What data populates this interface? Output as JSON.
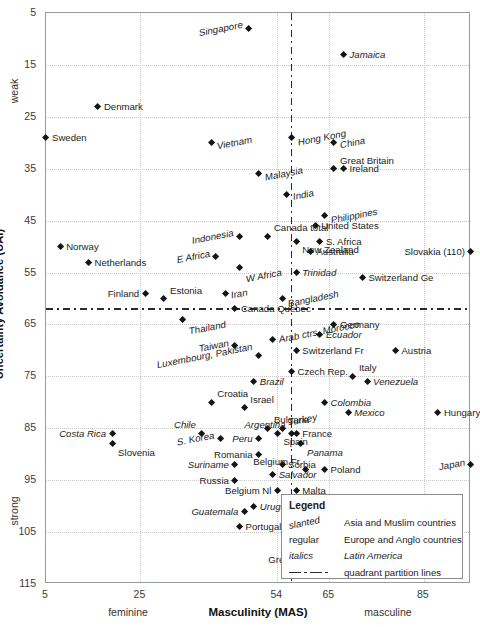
{
  "chart_data": {
    "type": "scatter",
    "title": "",
    "xlabel": "Masculinity (MAS)",
    "ylabel": "Uncertainty Avoidance (UAI)",
    "xlim": [
      5,
      95
    ],
    "ylim": [
      5,
      115
    ],
    "x_ticks": [
      "5",
      "25",
      "54",
      "65",
      "85"
    ],
    "x_tick_values": [
      5,
      25,
      54,
      65,
      85
    ],
    "y_ticks": [
      "5",
      "15",
      "25",
      "35",
      "45",
      "55",
      "65",
      "75",
      "85",
      "95",
      "105",
      "115"
    ],
    "y_tick_values": [
      5,
      15,
      25,
      35,
      45,
      55,
      65,
      75,
      85,
      95,
      105,
      115
    ],
    "x_pole_low": "feminine",
    "x_pole_high": "masculine",
    "y_pole_low": "weak",
    "y_pole_high": "strong",
    "grid": true,
    "partition_x": 57,
    "partition_y": 62,
    "axis_inverted_y": true,
    "points": [
      {
        "label": "Singapore",
        "x": 48,
        "y": 8,
        "style": "slanted",
        "pos": "left"
      },
      {
        "label": "Jamaica",
        "x": 68,
        "y": 13,
        "style": "italics",
        "pos": "right"
      },
      {
        "label": "Denmark",
        "x": 16,
        "y": 23,
        "style": "regular",
        "pos": "right"
      },
      {
        "label": "Sweden",
        "x": 5,
        "y": 29,
        "style": "regular",
        "pos": "right"
      },
      {
        "label": "Vietnam",
        "x": 40,
        "y": 30,
        "style": "slanted",
        "pos": "right"
      },
      {
        "label": "Hong Kong",
        "x": 57,
        "y": 29,
        "style": "slanted",
        "pos": "right"
      },
      {
        "label": "China",
        "x": 66,
        "y": 30,
        "style": "slanted",
        "pos": "right"
      },
      {
        "label": "Malaysia",
        "x": 50,
        "y": 36,
        "style": "slanted",
        "pos": "right"
      },
      {
        "label": "Great Britain",
        "x": 66,
        "y": 35,
        "style": "regular",
        "pos": "above"
      },
      {
        "label": "Ireland",
        "x": 68,
        "y": 35,
        "style": "regular",
        "pos": "right"
      },
      {
        "label": "India",
        "x": 56,
        "y": 40,
        "style": "slanted",
        "pos": "right"
      },
      {
        "label": "Philippines",
        "x": 64,
        "y": 44,
        "style": "slanted",
        "pos": "right"
      },
      {
        "label": "Norway",
        "x": 8,
        "y": 50,
        "style": "regular",
        "pos": "right"
      },
      {
        "label": "Netherlands",
        "x": 14,
        "y": 53,
        "style": "regular",
        "pos": "right"
      },
      {
        "label": "Indonesia",
        "x": 46,
        "y": 48,
        "style": "slanted",
        "pos": "left"
      },
      {
        "label": "Canada total",
        "x": 52,
        "y": 48,
        "style": "regular",
        "pos": "above"
      },
      {
        "label": "United States",
        "x": 62,
        "y": 46,
        "style": "regular",
        "pos": "right"
      },
      {
        "label": "S. Africa",
        "x": 63,
        "y": 49,
        "style": "regular",
        "pos": "right"
      },
      {
        "label": "New Zealand",
        "x": 58,
        "y": 49,
        "style": "regular",
        "pos": "below"
      },
      {
        "label": "Australia",
        "x": 61,
        "y": 51,
        "style": "regular",
        "pos": "right"
      },
      {
        "label": "E Africa",
        "x": 41,
        "y": 52,
        "style": "slanted",
        "pos": "left"
      },
      {
        "label": "Slovakia (110)",
        "x": 95,
        "y": 51,
        "style": "regular",
        "pos": "left"
      },
      {
        "label": "W Africa",
        "x": 46,
        "y": 54,
        "style": "slanted",
        "pos": "below"
      },
      {
        "label": "Finland",
        "x": 26,
        "y": 59,
        "style": "regular",
        "pos": "left"
      },
      {
        "label": "Estonia",
        "x": 30,
        "y": 60,
        "style": "regular",
        "pos": "above"
      },
      {
        "label": "Iran",
        "x": 43,
        "y": 59,
        "style": "slanted",
        "pos": "right"
      },
      {
        "label": "Trinidad",
        "x": 58,
        "y": 55,
        "style": "italics",
        "pos": "right"
      },
      {
        "label": "Switzerland Ge",
        "x": 72,
        "y": 56,
        "style": "regular",
        "pos": "right"
      },
      {
        "label": "Canada Quebec",
        "x": 45,
        "y": 62,
        "style": "regular",
        "pos": "right"
      },
      {
        "label": "Bangladesh",
        "x": 55,
        "y": 60,
        "style": "slanted",
        "pos": "right"
      },
      {
        "label": "Thailand",
        "x": 34,
        "y": 64,
        "style": "slanted",
        "pos": "below"
      },
      {
        "label": "Arab ctrs, Morocco",
        "x": 53,
        "y": 68,
        "style": "slanted",
        "pos": "above"
      },
      {
        "label": "Germany",
        "x": 66,
        "y": 65,
        "style": "regular",
        "pos": "right"
      },
      {
        "label": "Ecuador",
        "x": 63,
        "y": 67,
        "style": "italics",
        "pos": "right"
      },
      {
        "label": "Taiwan",
        "x": 45,
        "y": 69,
        "style": "slanted",
        "pos": "left"
      },
      {
        "label": "Switzerland Fr",
        "x": 58,
        "y": 70,
        "style": "regular",
        "pos": "right"
      },
      {
        "label": "Austria",
        "x": 79,
        "y": 70,
        "style": "regular",
        "pos": "right"
      },
      {
        "label": "Luxembourg, Pakistan",
        "x": 50,
        "y": 71,
        "style": "slanted",
        "pos": "left"
      },
      {
        "label": "Czech Rep.",
        "x": 57,
        "y": 74,
        "style": "regular",
        "pos": "right"
      },
      {
        "label": "Italy",
        "x": 70,
        "y": 75,
        "style": "regular",
        "pos": "above"
      },
      {
        "label": "Brazil",
        "x": 49,
        "y": 76,
        "style": "italics",
        "pos": "right"
      },
      {
        "label": "Venezuela",
        "x": 73,
        "y": 76,
        "style": "italics",
        "pos": "right"
      },
      {
        "label": "Croatia",
        "x": 40,
        "y": 80,
        "style": "regular",
        "pos": "above"
      },
      {
        "label": "Israel",
        "x": 47,
        "y": 81,
        "style": "regular",
        "pos": "above"
      },
      {
        "label": "Colombia",
        "x": 64,
        "y": 80,
        "style": "italics",
        "pos": "right"
      },
      {
        "label": "Mexico",
        "x": 69,
        "y": 82,
        "style": "italics",
        "pos": "right"
      },
      {
        "label": "Hungary",
        "x": 88,
        "y": 82,
        "style": "regular",
        "pos": "right"
      },
      {
        "label": "Bulgaria",
        "x": 52,
        "y": 85,
        "style": "regular",
        "pos": "above"
      },
      {
        "label": "Turkey",
        "x": 55,
        "y": 85,
        "style": "slanted",
        "pos": "above"
      },
      {
        "label": "Chile",
        "x": 38,
        "y": 86,
        "style": "italics",
        "pos": "lefta"
      },
      {
        "label": "Costa Rica",
        "x": 19,
        "y": 86,
        "style": "italics",
        "pos": "left"
      },
      {
        "label": "S. Korea",
        "x": 42,
        "y": 87,
        "style": "slanted",
        "pos": "left"
      },
      {
        "label": "Argentina",
        "x": 57,
        "y": 86,
        "style": "italics",
        "pos": "lefta"
      },
      {
        "label": "France",
        "x": 58,
        "y": 86,
        "style": "regular",
        "pos": "right"
      },
      {
        "label": "Spain",
        "x": 54,
        "y": 86,
        "style": "regular",
        "pos": "below"
      },
      {
        "label": "Peru",
        "x": 50,
        "y": 87,
        "style": "italics",
        "pos": "left"
      },
      {
        "label": "Panama",
        "x": 59,
        "y": 88,
        "style": "italics",
        "pos": "below"
      },
      {
        "label": "Slovenia",
        "x": 19,
        "y": 88,
        "style": "regular",
        "pos": "below"
      },
      {
        "label": "Romania",
        "x": 50,
        "y": 90,
        "style": "regular",
        "pos": "left"
      },
      {
        "label": "Suriname",
        "x": 45,
        "y": 92,
        "style": "italics",
        "pos": "left"
      },
      {
        "label": "Sorbia",
        "x": 55,
        "y": 92,
        "style": "regular",
        "pos": "right"
      },
      {
        "label": "Salvador",
        "x": 53,
        "y": 94,
        "style": "italics",
        "pos": "right"
      },
      {
        "label": "Russia",
        "x": 45,
        "y": 95,
        "style": "regular",
        "pos": "left"
      },
      {
        "label": "Poland",
        "x": 64,
        "y": 93,
        "style": "regular",
        "pos": "right"
      },
      {
        "label": "Belgium Fr",
        "x": 60,
        "y": 93,
        "style": "regular",
        "pos": "lefta"
      },
      {
        "label": "Japan",
        "x": 95,
        "y": 92,
        "style": "slanted",
        "pos": "left"
      },
      {
        "label": "Belgium Nl",
        "x": 54,
        "y": 97,
        "style": "regular",
        "pos": "left"
      },
      {
        "label": "Malta",
        "x": 58,
        "y": 97,
        "style": "regular",
        "pos": "right"
      },
      {
        "label": "Guatemala",
        "x": 47,
        "y": 101,
        "style": "italics",
        "pos": "left"
      },
      {
        "label": "Uruguay",
        "x": 49,
        "y": 100,
        "style": "italics",
        "pos": "right"
      },
      {
        "label": "Portugal",
        "x": 46,
        "y": 104,
        "style": "regular",
        "pos": "right"
      },
      {
        "label": "Greece",
        "x": 60,
        "y": 112,
        "style": "regular",
        "pos": "lefta"
      }
    ]
  },
  "legend": {
    "title": "Legend",
    "rows": [
      {
        "key": "slanted",
        "desc": "Asia and Muslim countries",
        "key_style": "slanted",
        "desc_style": "regular"
      },
      {
        "key": "regular",
        "desc": "Europe and Anglo countries",
        "key_style": "regular",
        "desc_style": "regular"
      },
      {
        "key": "italics",
        "desc": "Latin America",
        "key_style": "italics",
        "desc_style": "italics"
      },
      {
        "key": "",
        "desc": "quadrant partition lines",
        "key_style": "line",
        "desc_style": "regular"
      }
    ]
  },
  "colors": {
    "marker": "#151515",
    "grid": "#c9c9c9",
    "frame": "#9a9a9a",
    "partition": "#2b2b2b",
    "text": "#1c1c1c"
  }
}
